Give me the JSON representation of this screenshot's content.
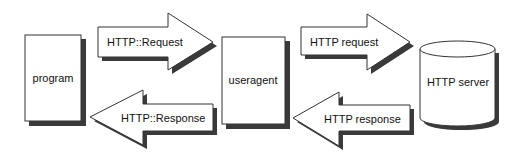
{
  "diagram": {
    "nodes": {
      "program": {
        "label": "program",
        "shape": "rectangle"
      },
      "useragent": {
        "label": "useragent",
        "shape": "rectangle"
      },
      "server": {
        "label": "HTTP server",
        "shape": "cylinder"
      }
    },
    "arrows": {
      "perl_request": {
        "label": "HTTP::Request",
        "direction": "right",
        "from": "program",
        "to": "useragent"
      },
      "perl_response": {
        "label": "HTTP::Response",
        "direction": "left",
        "from": "useragent",
        "to": "program"
      },
      "http_request": {
        "label": "HTTP request",
        "direction": "right",
        "from": "useragent",
        "to": "server"
      },
      "http_response": {
        "label": "HTTP response",
        "direction": "left",
        "from": "server",
        "to": "useragent"
      }
    },
    "colors": {
      "fill": "#ffffff",
      "stroke": "#333333",
      "shadow": "#3a3a3a"
    }
  }
}
